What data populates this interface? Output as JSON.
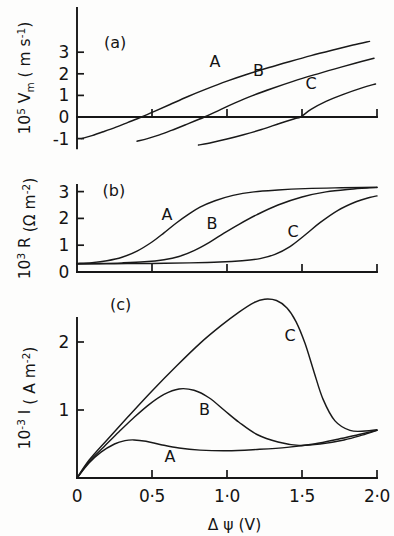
{
  "figure": {
    "background_color": "#fdfdfc",
    "ink_color": "#171717",
    "xaxis": {
      "label_delta": "Δ",
      "label_psi": "ψ",
      "label_unit": "(V)",
      "ticks": [
        {
          "value": 0,
          "text": "0"
        },
        {
          "value": 0.5,
          "text": "0·5"
        },
        {
          "value": 1.0,
          "text": "1·0"
        },
        {
          "value": 1.5,
          "text": "1·5"
        },
        {
          "value": 2.0,
          "text": "2·0"
        }
      ],
      "range": [
        0,
        2.0
      ]
    },
    "panels": [
      {
        "key": "a",
        "tag": "(a)",
        "ylabel": {
          "prefix": "10",
          "prefix_sup": "5",
          "symbol": "V",
          "symbol_sub": "m",
          "unit_open": "( m s",
          "unit_sup": "-1",
          "unit_close": ")"
        },
        "yticks": [
          {
            "value": 3,
            "text": "3"
          },
          {
            "value": 2,
            "text": "2"
          },
          {
            "value": 1,
            "text": "1"
          },
          {
            "value": 0,
            "text": "0"
          },
          {
            "value": -1,
            "text": "-1"
          }
        ],
        "ylim": [
          -1.45,
          3.6
        ],
        "curve_labels": [
          {
            "text": "A",
            "x": 0.92,
            "y": 2.33
          },
          {
            "text": "B",
            "x": 1.21,
            "y": 1.89
          },
          {
            "text": "C",
            "x": 1.56,
            "y": 1.28
          }
        ]
      },
      {
        "key": "b",
        "tag": "(b)",
        "ylabel": {
          "prefix": "10",
          "prefix_sup": "3",
          "symbol": "R",
          "symbol_sub": "",
          "unit_open": "(Ω m",
          "unit_sup": "-2",
          "unit_close": ")"
        },
        "yticks": [
          {
            "value": 3,
            "text": "3"
          },
          {
            "value": 2,
            "text": "2"
          },
          {
            "value": 1,
            "text": "1"
          },
          {
            "value": 0,
            "text": "0"
          }
        ],
        "ylim": [
          0,
          3.5
        ],
        "curve_labels": [
          {
            "text": "A",
            "x": 0.6,
            "y": 1.95
          },
          {
            "text": "B",
            "x": 0.9,
            "y": 1.62
          },
          {
            "text": "C",
            "x": 1.44,
            "y": 1.32
          }
        ]
      },
      {
        "key": "c",
        "tag": "(c)",
        "ylabel": {
          "prefix": "10",
          "prefix_sup": "-3",
          "symbol": "I",
          "symbol_sub": "",
          "unit_open": "( A m",
          "unit_sup": "-2",
          "unit_close": ")"
        },
        "yticks": [
          {
            "value": 2,
            "text": "2"
          },
          {
            "value": 1,
            "text": "1"
          }
        ],
        "ylim": [
          0,
          2.92
        ],
        "curve_labels": [
          {
            "text": "C",
            "x": 1.42,
            "y": 2.02
          },
          {
            "text": "B",
            "x": 0.85,
            "y": 0.92
          },
          {
            "text": "A",
            "x": 0.62,
            "y": 0.24
          }
        ],
        "panel_tag_pos": {
          "x": 0.22,
          "y": 2.47
        }
      }
    ]
  },
  "chart_data": [
    {
      "type": "line",
      "panel": "a",
      "title": "(a)",
      "xlabel": "Δ ψ (V)",
      "ylabel": "10^5 Vm (m s^-1)",
      "xlim": [
        0,
        2.0
      ],
      "ylim": [
        -1.45,
        3.6
      ],
      "grid": false,
      "legend": "inline curve labels A, B, C",
      "series": [
        {
          "name": "A",
          "zero_crossing": 0.43,
          "x": [
            0.03,
            0.1,
            0.18,
            0.26,
            0.34,
            0.43,
            0.52,
            0.62,
            0.74,
            0.86,
            1.0,
            1.14,
            1.28,
            1.42,
            1.56,
            1.7,
            1.84,
            1.95
          ],
          "y": [
            -1.0,
            -0.86,
            -0.67,
            -0.47,
            -0.25,
            0.0,
            0.27,
            0.58,
            0.95,
            1.29,
            1.66,
            1.99,
            2.29,
            2.57,
            2.84,
            3.09,
            3.33,
            3.5
          ]
        },
        {
          "name": "B",
          "zero_crossing": 0.85,
          "x": [
            0.4,
            0.47,
            0.55,
            0.63,
            0.72,
            0.85,
            0.95,
            1.05,
            1.17,
            1.3,
            1.44,
            1.58,
            1.72,
            1.86,
            1.98
          ],
          "y": [
            -1.12,
            -1.0,
            -0.83,
            -0.62,
            -0.37,
            0.0,
            0.32,
            0.64,
            0.99,
            1.32,
            1.65,
            1.95,
            2.23,
            2.5,
            2.72
          ]
        },
        {
          "name": "C",
          "zero_crossing": 1.49,
          "x": [
            0.81,
            0.9,
            1.0,
            1.11,
            1.23,
            1.35,
            1.45,
            1.49,
            1.56,
            1.66,
            1.78,
            1.9,
            1.99
          ],
          "y": [
            -1.3,
            -1.18,
            -1.02,
            -0.82,
            -0.58,
            -0.3,
            -0.08,
            0.0,
            0.35,
            0.72,
            1.06,
            1.35,
            1.53
          ]
        }
      ]
    },
    {
      "type": "line",
      "panel": "b",
      "title": "(b)",
      "xlabel": "Δ ψ (V)",
      "ylabel": "10^3 R (Ω m^-2)",
      "xlim": [
        0,
        2.0
      ],
      "ylim": [
        0,
        3.5
      ],
      "grid": false,
      "legend": "inline curve labels A, B, C",
      "series": [
        {
          "name": "A",
          "x": [
            0.0,
            0.1,
            0.2,
            0.3,
            0.4,
            0.5,
            0.58,
            0.66,
            0.74,
            0.82,
            0.92,
            1.04,
            1.18,
            1.34,
            1.52,
            1.72,
            1.9,
            2.0
          ],
          "y": [
            0.32,
            0.35,
            0.42,
            0.55,
            0.78,
            1.12,
            1.46,
            1.82,
            2.14,
            2.42,
            2.66,
            2.86,
            2.99,
            3.06,
            3.11,
            3.14,
            3.15,
            3.16
          ]
        },
        {
          "name": "B",
          "x": [
            0.0,
            0.15,
            0.3,
            0.45,
            0.58,
            0.68,
            0.78,
            0.88,
            0.98,
            1.08,
            1.2,
            1.34,
            1.5,
            1.66,
            1.82,
            1.95,
            2.0
          ],
          "y": [
            0.31,
            0.32,
            0.34,
            0.38,
            0.46,
            0.58,
            0.8,
            1.1,
            1.45,
            1.78,
            2.14,
            2.5,
            2.8,
            2.99,
            3.09,
            3.14,
            3.15
          ]
        },
        {
          "name": "C",
          "x": [
            0.0,
            0.25,
            0.5,
            0.75,
            0.95,
            1.1,
            1.22,
            1.32,
            1.42,
            1.52,
            1.62,
            1.74,
            1.86,
            1.95,
            2.0
          ],
          "y": [
            0.3,
            0.31,
            0.32,
            0.34,
            0.37,
            0.42,
            0.5,
            0.66,
            0.95,
            1.38,
            1.84,
            2.3,
            2.62,
            2.78,
            2.84
          ]
        }
      ]
    },
    {
      "type": "line",
      "panel": "c",
      "title": "(c)",
      "xlabel": "Δ ψ (V)",
      "ylabel": "10^-3 I (A m^-2)",
      "xlim": [
        0,
        2.0
      ],
      "ylim": [
        0,
        2.92
      ],
      "grid": false,
      "legend": "inline curve labels A, B, C",
      "series": [
        {
          "name": "A",
          "peak": {
            "x": 0.38,
            "y": 0.56
          },
          "x": [
            0.0,
            0.08,
            0.16,
            0.25,
            0.32,
            0.38,
            0.46,
            0.56,
            0.68,
            0.82,
            1.0,
            1.2,
            1.4,
            1.58,
            1.74,
            1.88,
            2.0
          ],
          "y": [
            0.0,
            0.22,
            0.38,
            0.5,
            0.55,
            0.56,
            0.54,
            0.49,
            0.44,
            0.41,
            0.4,
            0.42,
            0.45,
            0.5,
            0.57,
            0.64,
            0.7
          ]
        },
        {
          "name": "B",
          "peak": {
            "x": 0.68,
            "y": 1.31
          },
          "x": [
            0.0,
            0.08,
            0.18,
            0.28,
            0.38,
            0.48,
            0.58,
            0.68,
            0.78,
            0.88,
            0.98,
            1.08,
            1.2,
            1.34,
            1.48,
            1.62,
            1.78,
            1.9,
            2.0
          ],
          "y": [
            0.0,
            0.24,
            0.46,
            0.68,
            0.89,
            1.08,
            1.23,
            1.31,
            1.29,
            1.18,
            1.0,
            0.82,
            0.64,
            0.53,
            0.48,
            0.5,
            0.56,
            0.63,
            0.7
          ]
        },
        {
          "name": "C",
          "peak": {
            "x": 1.25,
            "y": 2.63
          },
          "x": [
            0.0,
            0.08,
            0.2,
            0.34,
            0.5,
            0.66,
            0.82,
            0.96,
            1.08,
            1.18,
            1.25,
            1.33,
            1.4,
            1.46,
            1.52,
            1.58,
            1.64,
            1.72,
            1.82,
            1.92,
            2.0
          ],
          "y": [
            0.0,
            0.26,
            0.56,
            0.9,
            1.28,
            1.64,
            1.98,
            2.24,
            2.44,
            2.58,
            2.63,
            2.61,
            2.5,
            2.3,
            1.98,
            1.56,
            1.16,
            0.84,
            0.7,
            0.69,
            0.71
          ]
        }
      ]
    }
  ]
}
